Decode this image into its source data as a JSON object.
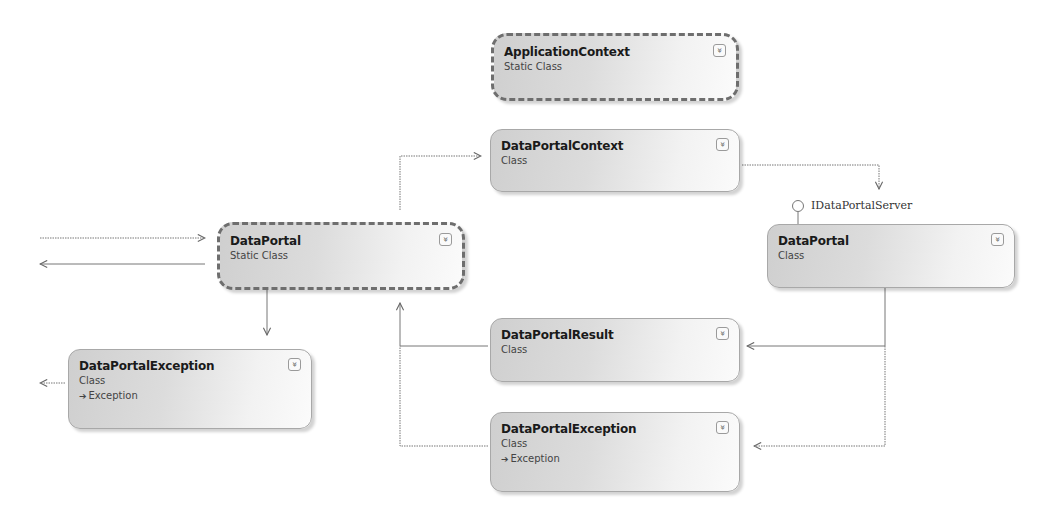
{
  "diagram": {
    "type": "class-diagram",
    "shapes": [
      {
        "id": "application-context",
        "name": "ApplicationContext",
        "kind": "Static Class",
        "static": true
      },
      {
        "id": "data-portal-context",
        "name": "DataPortalContext",
        "kind": "Class",
        "static": false
      },
      {
        "id": "data-portal-static",
        "name": "DataPortal",
        "kind": "Static Class",
        "static": true
      },
      {
        "id": "data-portal-server",
        "name": "DataPortal",
        "kind": "Class",
        "static": false,
        "implements": "IDataPortalServer"
      },
      {
        "id": "data-portal-exception-left",
        "name": "DataPortalException",
        "kind": "Class",
        "base": "Exception",
        "static": false
      },
      {
        "id": "data-portal-result",
        "name": "DataPortalResult",
        "kind": "Class",
        "static": false
      },
      {
        "id": "data-portal-exception-right",
        "name": "DataPortalException",
        "kind": "Class",
        "base": "Exception",
        "static": false
      }
    ],
    "interface_lollipop": "IDataPortalServer",
    "toggle_glyph": "»",
    "base_arrow_glyph": "➔",
    "connectors": [
      {
        "from": "external",
        "to": "data-portal-static",
        "style": "dotted",
        "direction": "in"
      },
      {
        "from": "data-portal-static",
        "to": "external",
        "style": "solid",
        "direction": "out"
      },
      {
        "from": "data-portal-static",
        "to": "data-portal-context",
        "style": "dotted"
      },
      {
        "from": "data-portal-context",
        "to": "data-portal-server",
        "style": "dotted"
      },
      {
        "from": "data-portal-static",
        "to": "data-portal-exception-left",
        "style": "solid"
      },
      {
        "from": "data-portal-exception-left",
        "to": "external",
        "style": "dotted"
      },
      {
        "from": "data-portal-server",
        "to": "data-portal-result",
        "style": "solid"
      },
      {
        "from": "data-portal-server",
        "to": "data-portal-exception-right",
        "style": "dotted"
      },
      {
        "from": "data-portal-result",
        "to": "data-portal-static",
        "style": "solid"
      },
      {
        "from": "data-portal-exception-right",
        "to": "data-portal-static",
        "style": "dotted"
      }
    ]
  }
}
